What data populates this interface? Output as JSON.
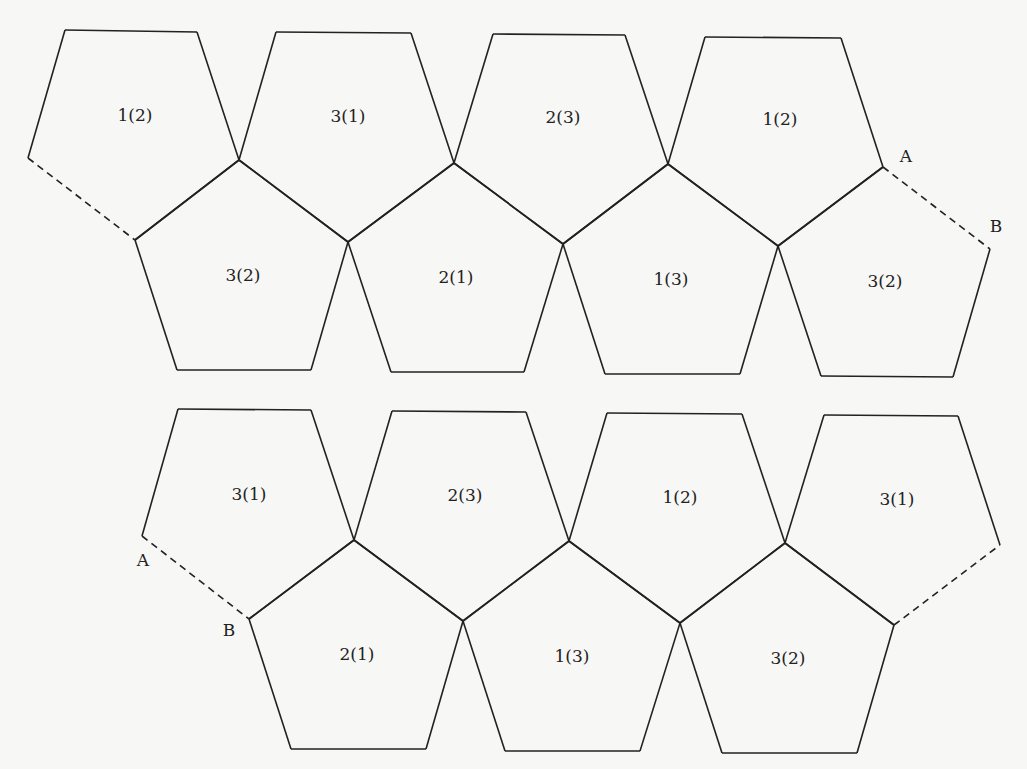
{
  "diagram": {
    "nets": [
      {
        "name": "top-net",
        "faces": [
          {
            "label": "1(2)",
            "points": "65,30 197,32 239,160 135,240 28,158",
            "lx": 135,
            "ly": 116
          },
          {
            "label": "3(1)",
            "points": "276,32 411,33 454,163 348,242 239,160",
            "lx": 348,
            "ly": 117
          },
          {
            "label": "2(3)",
            "points": "493,34 625,35 668,164 563,244 454,163",
            "lx": 563,
            "ly": 118
          },
          {
            "label": "1(2)",
            "points": "705,37 841,38 883,167 778,246 668,164",
            "lx": 780,
            "ly": 120
          },
          {
            "label": "3(2)",
            "points": "135,240 239,160 348,242 311,370 177,370",
            "lx": 243,
            "ly": 276
          },
          {
            "label": "2(1)",
            "points": "348,242 454,163 563,244 524,372 391,372",
            "lx": 456,
            "ly": 278
          },
          {
            "label": "1(3)",
            "points": "563,244 668,164 778,246 740,374 605,374",
            "lx": 671,
            "ly": 280
          },
          {
            "label": "3(2)",
            "points": "778,246 883,167 990,249 953,377 821,376",
            "lx": 885,
            "ly": 282
          }
        ],
        "dashed_edges": [
          {
            "x1": 28,
            "y1": 158,
            "x2": 135,
            "y2": 240
          },
          {
            "x1": 883,
            "y1": 167,
            "x2": 990,
            "y2": 249
          }
        ],
        "points": [
          {
            "label": "A",
            "x": 906,
            "y": 157
          },
          {
            "label": "B",
            "x": 996,
            "y": 227
          }
        ]
      },
      {
        "name": "bottom-net",
        "faces": [
          {
            "label": "3(1)",
            "points": "178,409 311,410 354,540 249,619 142,536",
            "lx": 249,
            "ly": 495
          },
          {
            "label": "2(3)",
            "points": "392,411 526,412 569,541 463,621 354,540",
            "lx": 465,
            "ly": 496
          },
          {
            "label": "1(2)",
            "points": "607,413 742,414 785,543 680,623 569,541",
            "lx": 680,
            "ly": 498
          },
          {
            "label": "3(1)",
            "points": "824,415 958,416 1000,545 894,625 785,543",
            "lx": 897,
            "ly": 500
          },
          {
            "label": "2(1)",
            "points": "249,619 354,540 463,621 426,749 291,749",
            "lx": 357,
            "ly": 655
          },
          {
            "label": "1(3)",
            "points": "463,621 569,541 680,623 640,751 505,751",
            "lx": 572,
            "ly": 657
          },
          {
            "label": "3(2)",
            "points": "680,623 785,543 894,625 857,753 722,753",
            "lx": 788,
            "ly": 659
          }
        ],
        "dashed_edges": [
          {
            "x1": 142,
            "y1": 536,
            "x2": 249,
            "y2": 619
          },
          {
            "x1": 894,
            "y1": 625,
            "x2": 1000,
            "y2": 545
          }
        ],
        "points": [
          {
            "label": "A",
            "x": 143,
            "y": 561
          },
          {
            "label": "B",
            "x": 229,
            "y": 631
          }
        ]
      }
    ]
  }
}
